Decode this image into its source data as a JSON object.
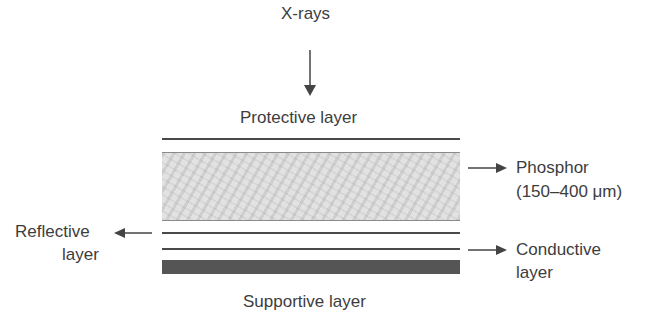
{
  "diagram": {
    "top_label": "X-rays",
    "protective_label": "Protective layer",
    "phosphor_label_1": "Phosphor",
    "phosphor_label_2": "(150–400 μm)",
    "reflective_label_1": "Reflective",
    "reflective_label_2": "layer",
    "conductive_label_1": "Conductive",
    "conductive_label_2": "layer",
    "supportive_label": "Supportive layer"
  },
  "colors": {
    "line": "#4a4a4a",
    "phosphor_fill": "#e2e2e2",
    "support_fill": "#555555",
    "text": "#3d3d3d"
  }
}
